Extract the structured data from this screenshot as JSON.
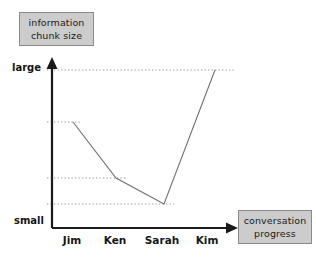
{
  "figure": {
    "y_axis_title_line1": "information",
    "y_axis_title_line2": "chunk size",
    "x_axis_title_line1": "conversation",
    "x_axis_title_line2": "progress",
    "y_tick_top": "large",
    "y_tick_bottom": "small",
    "colors": {
      "box_fill": "#cccccc",
      "box_border": "#8a8a8a",
      "axis": "#1a1a1a",
      "data_line": "#707070",
      "guide_line": "#9a9a9a",
      "text": "#161616",
      "background": "#ffffff"
    }
  },
  "chart_data": {
    "type": "line",
    "title": "",
    "subtitle": "",
    "xlabel": "conversation progress",
    "ylabel": "information chunk size",
    "categories": [
      "Jim",
      "Ken",
      "Sarah",
      "Kim"
    ],
    "values": [
      0.62,
      0.25,
      0.07,
      1.0
    ],
    "value_labels": [
      "",
      "",
      "",
      ""
    ],
    "ytick_labels": [
      "small",
      "large"
    ],
    "ytick_values": [
      0.0,
      1.0
    ],
    "ylim": [
      0.0,
      1.0
    ],
    "grid": "horizontal-dotted-guides-per-point",
    "legend": "none",
    "annotations": [
      "Information chunk size starts fairly large for Jim, decreases through Ken, reaches its smallest value at Sarah, then rises steeply to large at Kim."
    ],
    "series": [
      {
        "name": "information chunk size",
        "points": [
          {
            "x": "Jim",
            "y": 0.62
          },
          {
            "x": "Ken",
            "y": 0.25
          },
          {
            "x": "Sarah",
            "y": 0.07
          },
          {
            "x": "Kim",
            "y": 1.0
          }
        ]
      }
    ],
    "pixel_geometry": {
      "axis_x": 52,
      "axis_y": 228,
      "y_arrow_tip_y": 58,
      "x_arrow_tip_x": 238,
      "y_large_px": 70,
      "points_px": [
        {
          "x": 73,
          "y": 122
        },
        {
          "x": 116,
          "y": 178
        },
        {
          "x": 164,
          "y": 204
        },
        {
          "x": 215,
          "y": 70
        }
      ],
      "guide_right_edges": [
        82,
        126,
        174,
        235
      ],
      "category_label_x": [
        72,
        115,
        162,
        207
      ]
    }
  }
}
